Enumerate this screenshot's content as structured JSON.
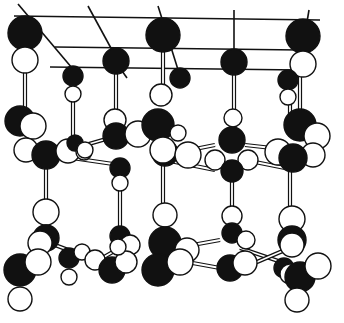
{
  "diagram": {
    "title": "",
    "colors": {
      "dark_atom": "#111111",
      "light_atom": "#ffffff",
      "line": "#111111",
      "background": "#ffffff"
    },
    "top_lines": [
      [
        14,
        16,
        320,
        20
      ],
      [
        55,
        47,
        300,
        50
      ],
      [
        50,
        67,
        300,
        70
      ],
      [
        18,
        4,
        72,
        68
      ],
      [
        88,
        6,
        112,
        50
      ],
      [
        158,
        6,
        180,
        76
      ],
      [
        234,
        10,
        234,
        52
      ],
      [
        309,
        10,
        307,
        22
      ],
      [
        120,
        68,
        127,
        78
      ]
    ],
    "bonds": [
      [
        25,
        60,
        25,
        125
      ],
      [
        73,
        90,
        73,
        140
      ],
      [
        116,
        60,
        116,
        135
      ],
      [
        163,
        35,
        163,
        95
      ],
      [
        234,
        60,
        234,
        115
      ],
      [
        300,
        65,
        300,
        110
      ],
      [
        290,
        95,
        290,
        115
      ],
      [
        163,
        150,
        163,
        210
      ],
      [
        120,
        175,
        120,
        230
      ],
      [
        232,
        165,
        232,
        215
      ],
      [
        290,
        160,
        290,
        220
      ],
      [
        46,
        160,
        46,
        205
      ],
      [
        68,
        150,
        120,
        135
      ],
      [
        72,
        158,
        120,
        165
      ],
      [
        165,
        155,
        215,
        145
      ],
      [
        165,
        160,
        215,
        170
      ],
      [
        245,
        145,
        290,
        150
      ],
      [
        245,
        160,
        285,
        168
      ],
      [
        55,
        245,
        95,
        260
      ],
      [
        90,
        265,
        125,
        245
      ],
      [
        165,
        250,
        220,
        240
      ],
      [
        165,
        258,
        220,
        268
      ],
      [
        240,
        248,
        290,
        265
      ],
      [
        250,
        265,
        285,
        250
      ]
    ],
    "atoms": [
      {
        "x": 25,
        "y": 33,
        "r": 17,
        "fill": "dark"
      },
      {
        "x": 25,
        "y": 60,
        "r": 13,
        "fill": "light"
      },
      {
        "x": 73,
        "y": 76,
        "r": 10,
        "fill": "dark"
      },
      {
        "x": 73,
        "y": 94,
        "r": 8,
        "fill": "light"
      },
      {
        "x": 116,
        "y": 61,
        "r": 13,
        "fill": "dark"
      },
      {
        "x": 163,
        "y": 35,
        "r": 17,
        "fill": "dark"
      },
      {
        "x": 180,
        "y": 78,
        "r": 10,
        "fill": "dark"
      },
      {
        "x": 234,
        "y": 62,
        "r": 13,
        "fill": "dark"
      },
      {
        "x": 303,
        "y": 36,
        "r": 17,
        "fill": "dark"
      },
      {
        "x": 303,
        "y": 64,
        "r": 13,
        "fill": "light"
      },
      {
        "x": 288,
        "y": 80,
        "r": 10,
        "fill": "dark"
      },
      {
        "x": 288,
        "y": 97,
        "r": 8,
        "fill": "light"
      },
      {
        "x": 161,
        "y": 95,
        "r": 11,
        "fill": "light"
      },
      {
        "x": 20,
        "y": 121,
        "r": 15,
        "fill": "dark"
      },
      {
        "x": 33,
        "y": 126,
        "r": 13,
        "fill": "light"
      },
      {
        "x": 26,
        "y": 150,
        "r": 12,
        "fill": "light"
      },
      {
        "x": 46,
        "y": 155,
        "r": 14,
        "fill": "dark"
      },
      {
        "x": 68,
        "y": 151,
        "r": 12,
        "fill": "light"
      },
      {
        "x": 75,
        "y": 143,
        "r": 8,
        "fill": "dark"
      },
      {
        "x": 84,
        "y": 152,
        "r": 8,
        "fill": "light"
      },
      {
        "x": 115,
        "y": 120,
        "r": 11,
        "fill": "light"
      },
      {
        "x": 116,
        "y": 136,
        "r": 13,
        "fill": "dark"
      },
      {
        "x": 138,
        "y": 134,
        "r": 13,
        "fill": "light"
      },
      {
        "x": 158,
        "y": 125,
        "r": 16,
        "fill": "dark"
      },
      {
        "x": 178,
        "y": 133,
        "r": 8,
        "fill": "light"
      },
      {
        "x": 165,
        "y": 153,
        "r": 13,
        "fill": "dark"
      },
      {
        "x": 163,
        "y": 150,
        "r": 13,
        "fill": "light"
      },
      {
        "x": 188,
        "y": 155,
        "r": 13,
        "fill": "light"
      },
      {
        "x": 120,
        "y": 168,
        "r": 10,
        "fill": "dark"
      },
      {
        "x": 120,
        "y": 183,
        "r": 8,
        "fill": "light"
      },
      {
        "x": 85,
        "y": 150,
        "r": 8,
        "fill": "light"
      },
      {
        "x": 233,
        "y": 118,
        "r": 9,
        "fill": "light"
      },
      {
        "x": 232,
        "y": 140,
        "r": 13,
        "fill": "dark"
      },
      {
        "x": 215,
        "y": 160,
        "r": 10,
        "fill": "light"
      },
      {
        "x": 248,
        "y": 160,
        "r": 10,
        "fill": "light"
      },
      {
        "x": 232,
        "y": 171,
        "r": 11,
        "fill": "dark"
      },
      {
        "x": 278,
        "y": 152,
        "r": 13,
        "fill": "light"
      },
      {
        "x": 300,
        "y": 125,
        "r": 16,
        "fill": "dark"
      },
      {
        "x": 317,
        "y": 136,
        "r": 13,
        "fill": "light"
      },
      {
        "x": 313,
        "y": 155,
        "r": 12,
        "fill": "light"
      },
      {
        "x": 293,
        "y": 158,
        "r": 14,
        "fill": "dark"
      },
      {
        "x": 46,
        "y": 212,
        "r": 13,
        "fill": "light"
      },
      {
        "x": 46,
        "y": 238,
        "r": 13,
        "fill": "dark"
      },
      {
        "x": 40,
        "y": 243,
        "r": 12,
        "fill": "light"
      },
      {
        "x": 20,
        "y": 270,
        "r": 16,
        "fill": "dark"
      },
      {
        "x": 38,
        "y": 262,
        "r": 13,
        "fill": "light"
      },
      {
        "x": 20,
        "y": 299,
        "r": 12,
        "fill": "light"
      },
      {
        "x": 69,
        "y": 258,
        "r": 10,
        "fill": "dark"
      },
      {
        "x": 69,
        "y": 277,
        "r": 8,
        "fill": "light"
      },
      {
        "x": 82,
        "y": 252,
        "r": 8,
        "fill": "light"
      },
      {
        "x": 95,
        "y": 260,
        "r": 10,
        "fill": "light"
      },
      {
        "x": 120,
        "y": 236,
        "r": 10,
        "fill": "dark"
      },
      {
        "x": 130,
        "y": 245,
        "r": 10,
        "fill": "light"
      },
      {
        "x": 112,
        "y": 270,
        "r": 13,
        "fill": "dark"
      },
      {
        "x": 126,
        "y": 262,
        "r": 11,
        "fill": "light"
      },
      {
        "x": 118,
        "y": 247,
        "r": 8,
        "fill": "light"
      },
      {
        "x": 165,
        "y": 215,
        "r": 12,
        "fill": "light"
      },
      {
        "x": 165,
        "y": 243,
        "r": 16,
        "fill": "dark"
      },
      {
        "x": 187,
        "y": 250,
        "r": 12,
        "fill": "light"
      },
      {
        "x": 158,
        "y": 270,
        "r": 16,
        "fill": "dark"
      },
      {
        "x": 180,
        "y": 262,
        "r": 13,
        "fill": "light"
      },
      {
        "x": 232,
        "y": 216,
        "r": 10,
        "fill": "light"
      },
      {
        "x": 232,
        "y": 233,
        "r": 10,
        "fill": "dark"
      },
      {
        "x": 246,
        "y": 240,
        "r": 9,
        "fill": "light"
      },
      {
        "x": 230,
        "y": 268,
        "r": 13,
        "fill": "dark"
      },
      {
        "x": 245,
        "y": 263,
        "r": 12,
        "fill": "light"
      },
      {
        "x": 292,
        "y": 219,
        "r": 13,
        "fill": "light"
      },
      {
        "x": 292,
        "y": 240,
        "r": 14,
        "fill": "dark"
      },
      {
        "x": 292,
        "y": 245,
        "r": 12,
        "fill": "light"
      },
      {
        "x": 284,
        "y": 268,
        "r": 10,
        "fill": "dark"
      },
      {
        "x": 290,
        "y": 274,
        "r": 10,
        "fill": "light"
      },
      {
        "x": 300,
        "y": 277,
        "r": 15,
        "fill": "dark"
      },
      {
        "x": 318,
        "y": 266,
        "r": 13,
        "fill": "light"
      },
      {
        "x": 297,
        "y": 300,
        "r": 12,
        "fill": "light"
      }
    ]
  }
}
